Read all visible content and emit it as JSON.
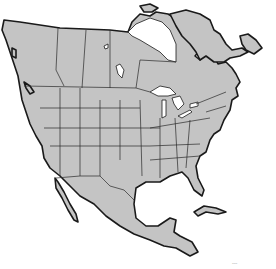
{
  "map": {
    "region": "North America",
    "style": "outline map",
    "colors": {
      "land": "#c4c4c4",
      "border": "#1a1a1a",
      "water": "#ffffff"
    },
    "features": [
      "Canada provinces",
      "United States states",
      "Mexico",
      "Cuba",
      "Great Lakes",
      "Greenland (partial)",
      "Hudson Bay"
    ],
    "credit_text": "~~~"
  }
}
